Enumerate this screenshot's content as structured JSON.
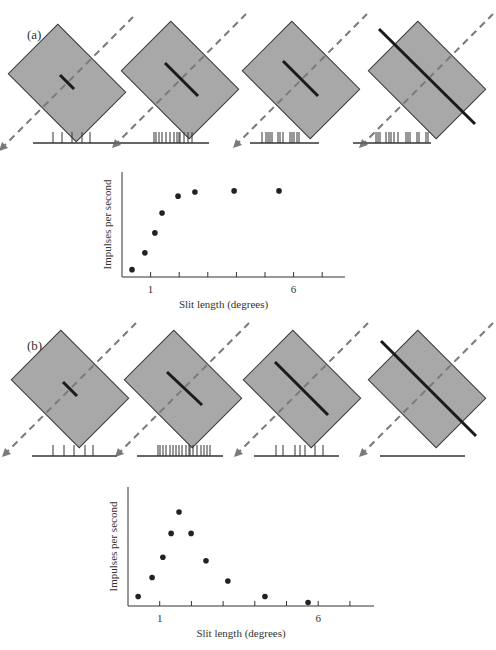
{
  "panels": [
    {
      "label": "(a)",
      "description": "Slit of increasing length centered on receptive field; response saturates",
      "stimuli": [
        {
          "box": {
            "cx": 67,
            "cy": 83,
            "w": 70,
            "h": 96
          },
          "bar": {
            "x1": 60,
            "y1": 75,
            "x2": 74,
            "y2": 89
          },
          "slit_len": "short"
        },
        {
          "box": {
            "cx": 180,
            "cy": 80,
            "w": 70,
            "h": 96
          },
          "bar": {
            "x1": 165,
            "y1": 63,
            "x2": 198,
            "y2": 96
          },
          "slit_len": "medium"
        },
        {
          "box": {
            "cx": 301,
            "cy": 80,
            "w": 70,
            "h": 96
          },
          "bar": {
            "x1": 283,
            "y1": 61,
            "x2": 318,
            "y2": 96
          },
          "slit_len": "long"
        },
        {
          "box": {
            "cx": 427,
            "cy": 80,
            "w": 70,
            "h": 96
          },
          "bar": {
            "x1": 379,
            "y1": 29,
            "x2": 475,
            "y2": 124
          },
          "slit_len": "very long"
        }
      ],
      "spike_trains": [
        {
          "x1": 33,
          "x2": 133,
          "y": 143,
          "spikes": [
            53,
            62,
            72,
            82,
            90
          ]
        },
        {
          "x1": 131,
          "x2": 209,
          "y": 143,
          "spikes": [
            154,
            156,
            159,
            162,
            166,
            170,
            174,
            177,
            179,
            180,
            184,
            188,
            192
          ]
        },
        {
          "x1": 250,
          "x2": 319,
          "y": 143,
          "spikes": [
            262,
            266,
            268,
            270,
            272,
            278,
            280,
            283,
            290,
            292,
            294,
            297,
            299
          ]
        },
        {
          "x1": 353,
          "x2": 431,
          "y": 143,
          "spikes": [
            376,
            378,
            380,
            386,
            389,
            391,
            394,
            398,
            406,
            408,
            410,
            417,
            419,
            426,
            428
          ]
        }
      ],
      "plot": {
        "origin_x": 122,
        "base_y": 277,
        "top_y": 172,
        "end_x": 345,
        "px_per_deg": 28.6,
        "ticks": [
          1,
          2,
          3,
          4,
          5,
          6,
          7
        ],
        "tick_labels": [
          {
            "value": 1,
            "text": "1"
          },
          {
            "value": 6,
            "text": "6"
          }
        ],
        "xlabel": "Slit length (degrees)",
        "ylabel": "Impulses per second"
      }
    },
    {
      "label": "(b)",
      "description": "Slit of increasing length; end-stopped cell, response drops for long slits",
      "stimuli": [
        {
          "box": {
            "cx": 70,
            "cy": 389,
            "w": 70,
            "h": 96
          },
          "bar": {
            "x1": 63,
            "y1": 382,
            "x2": 77,
            "y2": 396
          },
          "slit_len": "short"
        },
        {
          "box": {
            "cx": 183,
            "cy": 389,
            "w": 70,
            "h": 96
          },
          "bar": {
            "x1": 167,
            "y1": 372,
            "x2": 202,
            "y2": 405
          },
          "slit_len": "medium"
        },
        {
          "box": {
            "cx": 302,
            "cy": 389,
            "w": 70,
            "h": 96
          },
          "bar": {
            "x1": 275,
            "y1": 362,
            "x2": 328,
            "y2": 415
          },
          "slit_len": "long"
        },
        {
          "box": {
            "cx": 427,
            "cy": 389,
            "w": 70,
            "h": 96
          },
          "bar": {
            "x1": 381,
            "y1": 341,
            "x2": 476,
            "y2": 436
          },
          "slit_len": "very long"
        }
      ],
      "spike_trains": [
        {
          "x1": 32,
          "x2": 117,
          "y": 456,
          "spikes": [
            53,
            64,
            74,
            85,
            93
          ]
        },
        {
          "x1": 137,
          "x2": 223,
          "y": 456,
          "spikes": [
            158,
            160,
            163,
            166,
            170,
            173,
            176,
            179,
            182,
            186,
            189,
            190,
            193,
            197,
            201,
            204,
            207,
            210
          ]
        },
        {
          "x1": 254,
          "x2": 339,
          "y": 456,
          "spikes": [
            276,
            283,
            295,
            300,
            305,
            315,
            323
          ]
        },
        {
          "x1": 380,
          "x2": 465,
          "y": 456,
          "spikes": []
        }
      ],
      "plot": {
        "origin_x": 128,
        "base_y": 606,
        "top_y": 487,
        "end_x": 374,
        "px_per_deg": 31.7,
        "ticks": [
          1,
          2,
          3,
          4,
          5,
          6,
          7
        ],
        "tick_labels": [
          {
            "value": 1,
            "text": "1"
          },
          {
            "value": 6,
            "text": "6"
          }
        ],
        "xlabel": "Slit length (degrees)",
        "ylabel": "Impulses per second"
      }
    }
  ],
  "chart_data": [
    {
      "type": "scatter",
      "title": "(a)",
      "xlabel": "Slit length (degrees)",
      "ylabel": "Impulses per second",
      "x_ticks": [
        1,
        2,
        3,
        4,
        5,
        6,
        7
      ],
      "x_tick_labels": [
        "1",
        "6"
      ],
      "y_ticks": [],
      "xlim": [
        0,
        7.8
      ],
      "ylim": [
        0,
        100
      ],
      "grid": false,
      "y_units": "relative (no numeric scale shown)",
      "x": [
        0.35,
        0.8,
        1.15,
        1.4,
        1.96,
        2.55,
        3.92,
        5.49
      ],
      "y": [
        7,
        23,
        42,
        61,
        77,
        81,
        82,
        82
      ]
    },
    {
      "type": "scatter",
      "title": "(b)",
      "xlabel": "Slit length (degrees)",
      "ylabel": "Impulses per second",
      "x_ticks": [
        1,
        2,
        3,
        4,
        5,
        6,
        7
      ],
      "x_tick_labels": [
        "1",
        "6"
      ],
      "y_ticks": [],
      "xlim": [
        0,
        7.8
      ],
      "ylim": [
        0,
        100
      ],
      "grid": false,
      "y_units": "relative (no numeric scale shown)",
      "x": [
        0.32,
        0.76,
        1.1,
        1.36,
        1.61,
        1.99,
        2.46,
        3.15,
        4.32,
        5.68
      ],
      "y": [
        8,
        24,
        41,
        61,
        79,
        61,
        38,
        21,
        8,
        3
      ]
    }
  ],
  "colors": {
    "box_fill": "#a8a8a8",
    "box_stroke": "#3a3a3a",
    "bar": "#1a1a1a",
    "dashed_axis": "#7a7a7a",
    "spike": "#333333",
    "baseline": "#666666",
    "point": "#222222",
    "axis": "#333333"
  }
}
